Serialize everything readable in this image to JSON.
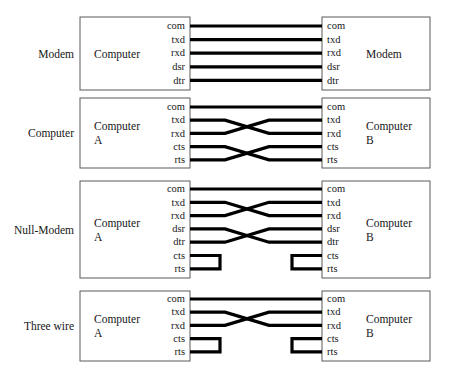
{
  "figure": {
    "background_color": "#ffffff",
    "wire_color": "#000000",
    "box_border_color": "#5a5a5a"
  },
  "rows": [
    {
      "row_label": "Modem",
      "left_box": {
        "line1": "Computer",
        "line2": ""
      },
      "right_box": {
        "line1": "Modem",
        "line2": ""
      },
      "pins_left": [
        "com",
        "txd",
        "rxd",
        "dsr",
        "dtr"
      ],
      "pins_right": [
        "com",
        "txd",
        "rxd",
        "dsr",
        "dtr"
      ],
      "connections": [
        {
          "from": "com",
          "to": "com",
          "kind": "straight"
        },
        {
          "from": "txd",
          "to": "txd",
          "kind": "straight"
        },
        {
          "from": "rxd",
          "to": "rxd",
          "kind": "straight"
        },
        {
          "from": "dsr",
          "to": "dsr",
          "kind": "straight"
        },
        {
          "from": "dtr",
          "to": "dtr",
          "kind": "straight"
        }
      ],
      "loopbacks_left": [],
      "loopbacks_right": []
    },
    {
      "row_label": "Computer",
      "left_box": {
        "line1": "Computer",
        "line2": "A"
      },
      "right_box": {
        "line1": "Computer",
        "line2": "B"
      },
      "pins_left": [
        "com",
        "txd",
        "rxd",
        "cts",
        "rts"
      ],
      "pins_right": [
        "com",
        "txd",
        "rxd",
        "cts",
        "rts"
      ],
      "connections": [
        {
          "from": "com",
          "to": "com",
          "kind": "straight"
        },
        {
          "from": "txd",
          "to": "rxd",
          "kind": "cross"
        },
        {
          "from": "rxd",
          "to": "txd",
          "kind": "cross"
        },
        {
          "from": "cts",
          "to": "rts",
          "kind": "cross"
        },
        {
          "from": "rts",
          "to": "cts",
          "kind": "cross"
        }
      ],
      "loopbacks_left": [],
      "loopbacks_right": []
    },
    {
      "row_label": "Null-Modem",
      "left_box": {
        "line1": "Computer",
        "line2": "A"
      },
      "right_box": {
        "line1": "Computer",
        "line2": "B"
      },
      "pins_left": [
        "com",
        "txd",
        "rxd",
        "dsr",
        "dtr",
        "cts",
        "rts"
      ],
      "pins_right": [
        "com",
        "txd",
        "rxd",
        "dsr",
        "dtr",
        "cts",
        "rts"
      ],
      "connections": [
        {
          "from": "com",
          "to": "com",
          "kind": "straight"
        },
        {
          "from": "txd",
          "to": "rxd",
          "kind": "cross"
        },
        {
          "from": "rxd",
          "to": "txd",
          "kind": "cross"
        },
        {
          "from": "dsr",
          "to": "dtr",
          "kind": "cross"
        },
        {
          "from": "dtr",
          "to": "dsr",
          "kind": "cross"
        }
      ],
      "loopbacks_left": [
        {
          "from": "cts",
          "to": "rts"
        }
      ],
      "loopbacks_right": [
        {
          "from": "cts",
          "to": "rts"
        }
      ]
    },
    {
      "row_label": "Three wire",
      "left_box": {
        "line1": "Computer",
        "line2": "A"
      },
      "right_box": {
        "line1": "Computer",
        "line2": "B"
      },
      "pins_left": [
        "com",
        "txd",
        "rxd",
        "cts",
        "rts"
      ],
      "pins_right": [
        "com",
        "txd",
        "rxd",
        "cts",
        "rts"
      ],
      "connections": [
        {
          "from": "com",
          "to": "com",
          "kind": "straight"
        },
        {
          "from": "txd",
          "to": "rxd",
          "kind": "cross"
        },
        {
          "from": "rxd",
          "to": "txd",
          "kind": "cross"
        }
      ],
      "loopbacks_left": [
        {
          "from": "cts",
          "to": "rts"
        }
      ],
      "loopbacks_right": [
        {
          "from": "cts",
          "to": "rts"
        }
      ]
    }
  ],
  "geometry": {
    "left_box_x": 80,
    "left_box_w": 110,
    "right_box_x": 322,
    "right_box_w": 108,
    "row_label_x": 74,
    "cross_center_x": 247,
    "loop_depth_left": 30,
    "loop_depth_right": 30,
    "rows_y": [
      {
        "top": 17,
        "height": 73,
        "pin_start": 26,
        "pin_gap": 13.6
      },
      {
        "top": 98,
        "height": 70,
        "pin_start": 107,
        "pin_gap": 13.2
      },
      {
        "top": 181,
        "height": 97,
        "pin_start": 189,
        "pin_gap": 13.3
      },
      {
        "top": 291,
        "height": 70,
        "pin_start": 299,
        "pin_gap": 13.2
      }
    ]
  }
}
